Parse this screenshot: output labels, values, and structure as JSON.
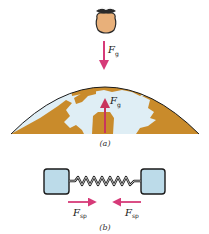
{
  "figure": {
    "panel_a": {
      "caption": "(a)",
      "object_label": "apple",
      "force_on_apple": {
        "symbol": "F",
        "subscript": "g",
        "direction": "down"
      },
      "force_on_earth": {
        "symbol": "F",
        "subscript": "g",
        "direction": "up"
      }
    },
    "panel_b": {
      "caption": "(b)",
      "left_force": {
        "symbol": "F",
        "subscript": "sp",
        "direction": "right"
      },
      "right_force": {
        "symbol": "F",
        "subscript": "sp",
        "direction": "left"
      }
    }
  },
  "colors": {
    "arrow": "#d63a78",
    "arrow_earth": "#b8304a",
    "land": "#c98b2b",
    "ice": "#dfeef5",
    "outline": "#1a1a1a",
    "block": "#bcdbe9",
    "fruit_body": "#e8b07a",
    "fruit_leaf": "#2a2a2a"
  }
}
